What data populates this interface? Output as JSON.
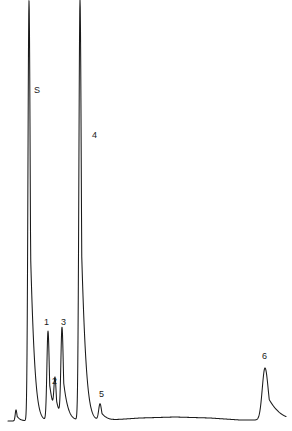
{
  "chart_data": {
    "type": "line",
    "title": "",
    "subtitle": "",
    "xlabel": "",
    "ylabel": "",
    "xlim": [
      0,
      292
    ],
    "ylim": [
      0,
      431
    ],
    "grid": false,
    "legend": "none",
    "axis_ticks_visible": false,
    "baseline_y": 420,
    "trace_start_x": 8,
    "trace_end_x": 286,
    "stroke_color": "#1a1a1a",
    "background_color": "#ffffff",
    "annotation_note": "Gas chromatogram trace; two tallest peaks (S and 4) are clipped at the top edge of the frame.",
    "peaks": [
      {
        "label": "inj",
        "label_visible": false,
        "x": 16,
        "apex_y": 409,
        "height_px": 11,
        "half_width_px": 1.2,
        "clipped": false,
        "label_x": 0,
        "label_y": 0
      },
      {
        "label": "S",
        "label_visible": true,
        "x": 29,
        "apex_y": 0,
        "height_px": 420,
        "half_width_px": 1.6,
        "clipped": true,
        "label_x": 34,
        "label_y": 86
      },
      {
        "label": "1",
        "label_visible": true,
        "x": 48,
        "apex_y": 331,
        "height_px": 89,
        "half_width_px": 1.7,
        "clipped": false,
        "label_x": 44,
        "label_y": 318
      },
      {
        "label": "2",
        "label_visible": true,
        "x": 55,
        "apex_y": 386,
        "height_px": 34,
        "half_width_px": 1.6,
        "clipped": false,
        "label_x": 52,
        "label_y": 377
      },
      {
        "label": "3",
        "label_visible": true,
        "x": 62,
        "apex_y": 331,
        "height_px": 89,
        "half_width_px": 1.7,
        "clipped": false,
        "label_x": 61,
        "label_y": 318
      },
      {
        "label": "4",
        "label_visible": true,
        "x": 80,
        "apex_y": 0,
        "height_px": 420,
        "half_width_px": 1.7,
        "clipped": true,
        "label_x": 92,
        "label_y": 131
      },
      {
        "label": "5",
        "label_visible": true,
        "x": 100,
        "apex_y": 404,
        "height_px": 16,
        "half_width_px": 2.0,
        "clipped": false,
        "label_x": 99,
        "label_y": 390
      },
      {
        "label": "6",
        "label_visible": true,
        "x": 265,
        "apex_y": 368,
        "height_px": 52,
        "half_width_px": 4.2,
        "clipped": false,
        "label_x": 262,
        "label_y": 352
      }
    ],
    "baseline_drift": [
      {
        "x": 8,
        "y": 421
      },
      {
        "x": 70,
        "y": 420
      },
      {
        "x": 110,
        "y": 420
      },
      {
        "x": 140,
        "y": 418
      },
      {
        "x": 175,
        "y": 417
      },
      {
        "x": 210,
        "y": 418
      },
      {
        "x": 240,
        "y": 420
      },
      {
        "x": 286,
        "y": 420
      }
    ]
  }
}
